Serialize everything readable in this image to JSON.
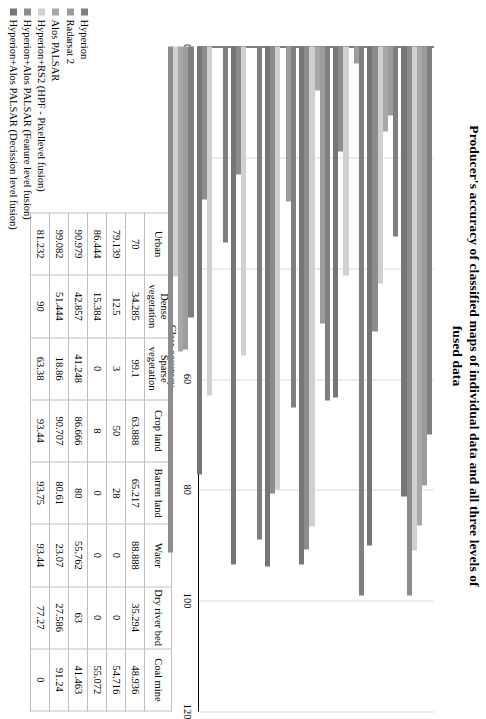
{
  "title": {
    "line1": "Producer's accuracy of classified maps of individual data and all three levels of",
    "line2": "fused data"
  },
  "axis": {
    "y_label": "Class accuracy",
    "ticks": [
      "0",
      "20",
      "40",
      "60",
      "80",
      "100",
      "120"
    ]
  },
  "legend": {
    "items": [
      {
        "label": "Hyperion",
        "color": "#7f7f7f"
      },
      {
        "label": "Radarsat 2",
        "color": "#9d9d9d"
      },
      {
        "label": "Alos PALSAR",
        "color": "#a8a8a8"
      },
      {
        "label": "Hyperion+RS2 (HPF - Pixellevel fusion)",
        "color": "#d0d0d0"
      },
      {
        "label": "Hyperion+Alos PALSAR (Feature level fusion)",
        "color": "#8c8c8c"
      },
      {
        "label": "Hyperion+Alos PALSAR (Decission level fusion)",
        "color": "#767676"
      }
    ]
  },
  "table": {
    "row_labels": [
      "Hyperion",
      "Radarsat 2",
      "Alos PALSAR",
      "Hyperion+RS2 (HPF - Pixellevel fusion)",
      "Hyperion+Alos PALSAR (Feature level fusion)",
      "Hyperion+Alos PALSAR (Decission level fusion)"
    ],
    "columns": [
      "Urban",
      "Dense vegetation",
      "Sparse vegetation",
      "Crop land",
      "Barren land",
      "Water",
      "Dry river bed",
      "Coal mine"
    ],
    "cells": [
      [
        "70",
        "34.285",
        "99.1",
        "63.888",
        "65.217",
        "88.888",
        "35.294",
        "48.936"
      ],
      [
        "79.139",
        "12.5",
        "3",
        "50",
        "28",
        "0",
        "0",
        "54.716"
      ],
      [
        "86.444",
        "15.384",
        "0",
        "8",
        "0",
        "0",
        "0",
        "55.072"
      ],
      [
        "90.979",
        "42.857",
        "41.248",
        "86.666",
        "80",
        "55.762",
        "63",
        "41.463"
      ],
      [
        "99.082",
        "51.444",
        "18.86",
        "90.707",
        "80.61",
        "23.07",
        "27.586",
        "91.24"
      ],
      [
        "81.232",
        "90",
        "63.38",
        "93.44",
        "93.75",
        "93.44",
        "77.27",
        "0"
      ]
    ]
  },
  "chart_data": {
    "type": "bar",
    "title": "Producer's accuracy of classified maps of individual data and all three levels of fused data",
    "xlabel": "",
    "ylabel": "Class accuracy",
    "ylim": [
      0,
      120
    ],
    "yticks": [
      0,
      20,
      40,
      60,
      80,
      100,
      120
    ],
    "grid": true,
    "legend_position": "bottom-left",
    "orientation": "vertical-bars-rendered-rotated",
    "categories": [
      "Urban",
      "Dense vegetation",
      "Sparse vegetation",
      "Crop land",
      "Barren land",
      "Water",
      "Dry river bed",
      "Coal mine"
    ],
    "series": [
      {
        "name": "Hyperion",
        "color": "#7f7f7f",
        "values": [
          70,
          34.285,
          99.1,
          63.888,
          65.217,
          88.888,
          35.294,
          48.936
        ]
      },
      {
        "name": "Radarsat 2",
        "color": "#9d9d9d",
        "values": [
          79.139,
          12.5,
          3,
          50,
          28,
          0,
          0,
          54.716
        ]
      },
      {
        "name": "Alos PALSAR",
        "color": "#a8a8a8",
        "values": [
          86.444,
          15.384,
          0,
          8,
          0,
          0,
          0,
          55.072
        ]
      },
      {
        "name": "Hyperion+RS2 (HPF - Pixellevel fusion)",
        "color": "#d0d0d0",
        "values": [
          90.979,
          42.857,
          41.248,
          86.666,
          80,
          55.762,
          63,
          41.463
        ]
      },
      {
        "name": "Hyperion+Alos PALSAR (Feature level fusion)",
        "color": "#8c8c8c",
        "values": [
          99.082,
          51.444,
          18.86,
          90.707,
          80.61,
          23.07,
          27.586,
          91.24
        ]
      },
      {
        "name": "Hyperion+Alos PALSAR (Decission level fusion)",
        "color": "#767676",
        "values": [
          81.232,
          90,
          63.38,
          93.44,
          93.75,
          93.44,
          77.27,
          0
        ]
      }
    ]
  }
}
